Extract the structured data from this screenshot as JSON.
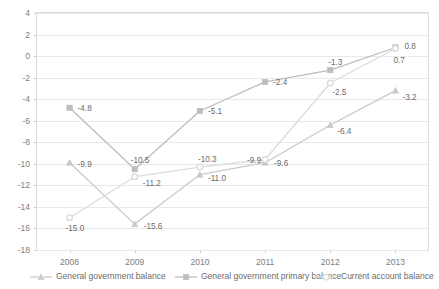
{
  "chart_data": {
    "type": "line",
    "title": "",
    "subtitle": "",
    "xlabel": "",
    "ylabel": "",
    "categories": [
      "2008",
      "2009",
      "2010",
      "2011",
      "2012",
      "2013"
    ],
    "ylim": [
      -18,
      4
    ],
    "ytick_step": 2,
    "yticks": [
      "4",
      "2",
      "0",
      "-2",
      "-4",
      "-6",
      "-8",
      "-10",
      "-12",
      "-14",
      "-16",
      "-18"
    ],
    "grid": true,
    "legend_position": "bottom",
    "series": [
      {
        "name": "General government balance",
        "marker": "triangle",
        "color": "#c9c9c9",
        "values": [
          -9.9,
          -15.6,
          -11.0,
          -9.9,
          -6.4,
          -3.2
        ],
        "labels": [
          "-9.9",
          "-15.6",
          "-11.0",
          "-9.9",
          "-6.4",
          "-3.2"
        ]
      },
      {
        "name": "General government primary balance",
        "marker": "square",
        "color": "#bdbdbd",
        "values": [
          -4.8,
          -10.5,
          -5.1,
          -2.4,
          -1.3,
          0.8
        ],
        "labels": [
          "-4.8",
          "-10.5",
          "-5.1",
          "-2.4",
          "-1.3",
          "0.8"
        ]
      },
      {
        "name": "Current account balance",
        "marker": "circle",
        "color": "#dcdcdc",
        "values": [
          -15.0,
          -11.2,
          -10.3,
          -9.6,
          -2.5,
          0.7
        ],
        "labels": [
          "-15.0",
          "-11.2",
          "-10.3",
          "-9.6",
          "-2.5",
          "0.7"
        ]
      }
    ]
  },
  "colors": {
    "background": "#ffffff",
    "grid": "#e9e9e9",
    "frame": "#dcdcdc",
    "text": "#6b6b6b"
  }
}
